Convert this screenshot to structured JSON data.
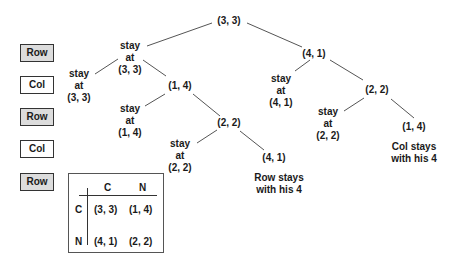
{
  "players": [
    {
      "label": "Row",
      "type": "row"
    },
    {
      "label": "Col",
      "type": "col"
    },
    {
      "label": "Row",
      "type": "row"
    },
    {
      "label": "Col",
      "type": "col"
    },
    {
      "label": "Row",
      "type": "row"
    }
  ],
  "tree": {
    "root": "(3, 3)",
    "left_stay": [
      "stay",
      "at",
      "(3, 3)"
    ],
    "left_far_stay": [
      "stay",
      "at",
      "(3, 3)"
    ],
    "n14": "(1, 4)",
    "n14_stay": [
      "stay",
      "at",
      "(1, 4)"
    ],
    "n22_left": "(2, 2)",
    "n22_left_stay": [
      "stay",
      "at",
      "(2, 2)"
    ],
    "n41_leaf": "(4, 1)",
    "row_note": [
      "Row stays",
      "with his 4"
    ],
    "n41": "(4, 1)",
    "n41_stay": [
      "stay",
      "at",
      "(4, 1)"
    ],
    "n22_right": "(2, 2)",
    "n22_right_stay": [
      "stay",
      "at",
      "(2, 2)"
    ],
    "n14_leaf": "(1, 4)",
    "col_note": [
      "Col stays",
      "with his 4"
    ]
  },
  "matrix": {
    "col_headers": [
      "C",
      "N"
    ],
    "row_headers": [
      "C",
      "N"
    ],
    "cells": [
      [
        "(3, 3)",
        "(1, 4)"
      ],
      [
        "(4, 1)",
        "(2, 2)"
      ]
    ]
  }
}
